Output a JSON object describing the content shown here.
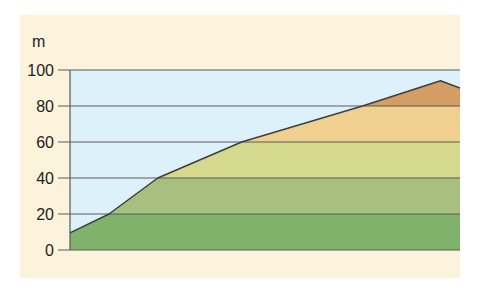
{
  "chart_data": {
    "type": "area",
    "title": "",
    "xlabel": "",
    "ylabel": "m",
    "ylim": [
      0,
      100
    ],
    "yticks": [
      0,
      20,
      40,
      60,
      80,
      100
    ],
    "grid": true,
    "legend": null,
    "profile": {
      "description": "Terrain elevation profile (x in relative distance 0-100)",
      "x": [
        0,
        10,
        22.5,
        44,
        75,
        95,
        100
      ],
      "y": [
        9.5,
        20,
        40,
        60,
        80,
        94,
        90
      ]
    },
    "bands": [
      {
        "from": 0,
        "to": 20,
        "color": "#7fb26a"
      },
      {
        "from": 20,
        "to": 40,
        "color": "#a7c07f"
      },
      {
        "from": 40,
        "to": 60,
        "color": "#d4d98e"
      },
      {
        "from": 60,
        "to": 80,
        "color": "#f0d08e"
      },
      {
        "from": 80,
        "to": 100,
        "color": "#d39d63"
      }
    ]
  },
  "colors": {
    "card_background": "#fcf3dc",
    "sky": "#ddf1fb",
    "gridline": "#5a5a5a",
    "outline": "#3e3e3e"
  }
}
